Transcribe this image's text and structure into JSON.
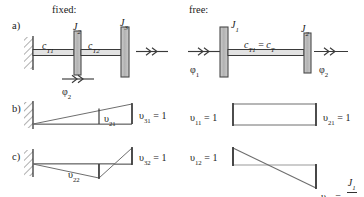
{
  "figure": {
    "width": 364,
    "height": 197,
    "headers": {
      "left": "fixed:",
      "right": "free:"
    },
    "row_labels": {
      "a": "a)",
      "b": "b)",
      "c": "c)"
    },
    "colors": {
      "line": "#3a3a3a",
      "disk_fill": "#b8b8b8",
      "disk_stroke": "#4a4a4a",
      "shaft_fill": "#d8d8d8",
      "hatch": "#6b6b6b",
      "text": "#1a1a1a"
    }
  },
  "panel_a_fixed": {
    "inertia_labels": [
      "J",
      "J"
    ],
    "inertia_subs": [
      "2",
      "3"
    ],
    "stiffness_labels": [
      "c",
      "c"
    ],
    "stiffness_subs": [
      "T1",
      "T2"
    ],
    "angle_labels": [
      {
        "base": "φ",
        "sub": "2"
      }
    ]
  },
  "panel_a_free": {
    "inertia_labels": [
      "J",
      "J"
    ],
    "inertia_subs": [
      "1",
      "2"
    ],
    "stiffness_label": "c",
    "stiffness_sub_left": "T1",
    "stiffness_equals": "=",
    "stiffness_label_right": "c",
    "stiffness_sub_right": "T",
    "angle_labels": [
      {
        "base": "φ",
        "sub": "1"
      },
      {
        "base": "φ",
        "sub": "2"
      }
    ]
  },
  "panel_b_fixed": {
    "mode_labels": [
      {
        "base": "υ",
        "sub": "21",
        "eq": ""
      },
      {
        "base": "υ",
        "sub": "31",
        "eq": "= 1"
      }
    ]
  },
  "panel_b_free": {
    "mode_labels": [
      {
        "base": "υ",
        "sub": "11",
        "eq": "= 1"
      },
      {
        "base": "υ",
        "sub": "21",
        "eq": "= 1"
      }
    ]
  },
  "panel_c_fixed": {
    "mode_labels": [
      {
        "base": "υ",
        "sub": "22",
        "eq": ""
      },
      {
        "base": "υ",
        "sub": "32",
        "eq": "= 1"
      }
    ]
  },
  "panel_c_free": {
    "mode_labels": [
      {
        "base": "υ",
        "sub": "12",
        "eq": "= 1"
      }
    ],
    "fraction_label": {
      "base": "υ",
      "sub": "22",
      "eq": "= -",
      "numerator": "J",
      "numerator_sub": "1",
      "denominator": "J",
      "denominator_sub": "2"
    }
  }
}
